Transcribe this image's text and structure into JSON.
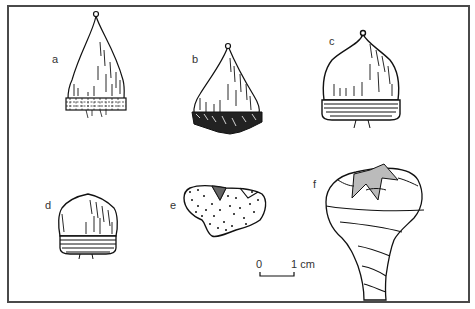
{
  "figure": {
    "specimens": [
      {
        "id": "a",
        "label": "a",
        "description": "acorn with scaly cupule at base"
      },
      {
        "id": "b",
        "label": "b",
        "description": "acorn with fringed, spiny cupule"
      },
      {
        "id": "c",
        "label": "c",
        "description": "larger acorn with ringed cupule"
      },
      {
        "id": "d",
        "label": "d",
        "description": "small acorn with ringed cupule"
      },
      {
        "id": "e",
        "label": "e",
        "description": "stippled cupule fragment"
      },
      {
        "id": "f",
        "label": "f",
        "description": "cupule on stalk with star-shaped top"
      }
    ],
    "scale_bar": {
      "start_label": "0",
      "end_label": "1 cm"
    }
  }
}
